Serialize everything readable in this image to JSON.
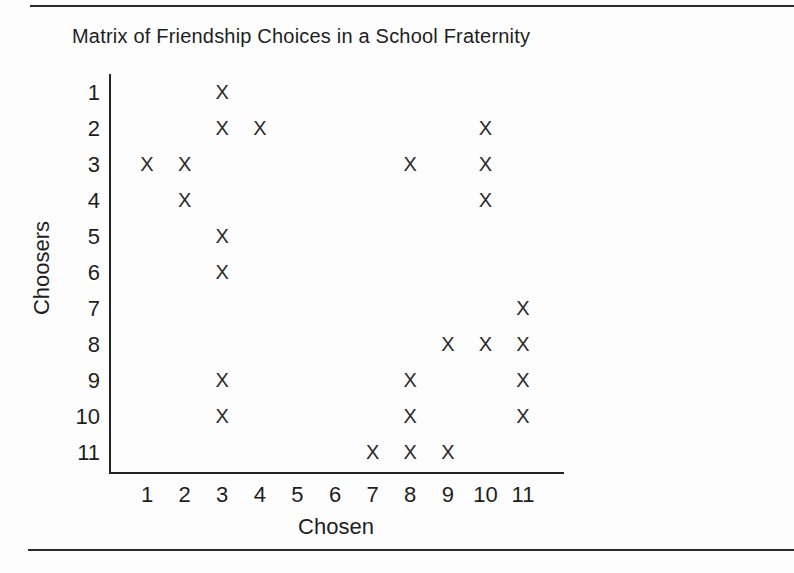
{
  "chart_data": {
    "type": "scatter",
    "title": "Matrix of Friendship Choices in a School Fraternity",
    "xlabel": "Chosen",
    "ylabel": "Choosers",
    "marker_glyph": "X",
    "x_ticks": [
      1,
      2,
      3,
      4,
      5,
      6,
      7,
      8,
      9,
      10,
      11
    ],
    "y_ticks": [
      1,
      2,
      3,
      4,
      5,
      6,
      7,
      8,
      9,
      10,
      11
    ],
    "xlim": [
      0.5,
      11.5
    ],
    "ylim": [
      0.5,
      11.5
    ],
    "grid": false,
    "legend": null,
    "choices": [
      {
        "chooser": 1,
        "chosen": [
          3
        ]
      },
      {
        "chooser": 2,
        "chosen": [
          3,
          4,
          10
        ]
      },
      {
        "chooser": 3,
        "chosen": [
          1,
          2,
          8,
          10
        ]
      },
      {
        "chooser": 4,
        "chosen": [
          2,
          10
        ]
      },
      {
        "chooser": 5,
        "chosen": [
          3
        ]
      },
      {
        "chooser": 6,
        "chosen": [
          3
        ]
      },
      {
        "chooser": 7,
        "chosen": [
          11
        ]
      },
      {
        "chooser": 8,
        "chosen": [
          9,
          10,
          11
        ]
      },
      {
        "chooser": 9,
        "chosen": [
          3,
          8,
          11
        ]
      },
      {
        "chooser": 10,
        "chosen": [
          3,
          8,
          11
        ]
      },
      {
        "chooser": 11,
        "chosen": [
          7,
          8,
          9
        ]
      }
    ]
  },
  "colors": {
    "background": "#fdfdfd",
    "ink": "#1e1e1e",
    "rule": "#2a2a2a"
  }
}
